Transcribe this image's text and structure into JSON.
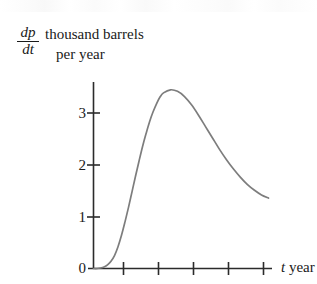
{
  "figure": {
    "name": "rate-of-oil-production-graph",
    "curve_color": "#7d7d7d",
    "axis_color": "#2b2b2b",
    "background": "#ffffff"
  },
  "y_axis_caption": {
    "fraction_numerator": "dp",
    "fraction_denominator": "dt",
    "units_line_1": "thousand barrels",
    "units_line_2": "per year"
  },
  "x_axis_caption": {
    "variable": "t",
    "units": "year"
  },
  "chart_data": {
    "type": "line",
    "title": "",
    "xlabel": "t year",
    "ylabel": "dp/dt thousand barrels per year",
    "xlim": [
      0,
      5.3
    ],
    "ylim": [
      0,
      3.6
    ],
    "grid": false,
    "legend": false,
    "y_ticks": [
      "0",
      "1",
      "2",
      "3"
    ],
    "y_tick_values": [
      0,
      1,
      2,
      3
    ],
    "x_ticks": [
      "",
      "",
      "",
      "",
      ""
    ],
    "x_tick_values": [
      1,
      2,
      3,
      4,
      5
    ],
    "series": [
      {
        "name": "rate of oil production",
        "x": [
          0.0,
          0.1,
          0.2,
          0.3,
          0.4,
          0.5,
          0.6,
          0.7,
          0.8,
          0.9,
          1.0,
          1.1,
          1.2,
          1.3,
          1.4,
          1.5,
          1.6,
          1.7,
          1.8,
          1.9,
          2.0,
          2.2,
          2.4,
          2.6,
          2.8,
          3.0,
          3.2,
          3.4,
          3.6,
          3.8,
          4.0,
          4.2,
          4.4,
          4.6,
          4.8,
          5.0
        ],
        "y": [
          0.0,
          0.0,
          0.01,
          0.03,
          0.07,
          0.14,
          0.25,
          0.42,
          0.64,
          0.9,
          1.18,
          1.48,
          1.78,
          2.07,
          2.35,
          2.6,
          2.83,
          3.02,
          3.18,
          3.31,
          3.39,
          3.45,
          3.42,
          3.32,
          3.16,
          2.96,
          2.74,
          2.52,
          2.3,
          2.1,
          1.92,
          1.76,
          1.62,
          1.51,
          1.42,
          1.36
        ]
      }
    ],
    "annotations": {
      "peak_value": 3.45,
      "peak_time": 2.2,
      "end_value": 1.36
    }
  }
}
